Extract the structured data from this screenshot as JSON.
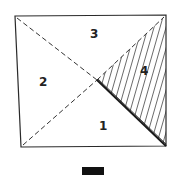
{
  "diagram": {
    "regions": [
      {
        "id": "1",
        "label": "1",
        "position": "bottom",
        "shaded": false
      },
      {
        "id": "2",
        "label": "2",
        "position": "left",
        "shaded": false
      },
      {
        "id": "3",
        "label": "3",
        "position": "top",
        "shaded": false
      },
      {
        "id": "4",
        "label": "4",
        "position": "right",
        "shaded": true
      }
    ],
    "colors": {
      "stroke": "#2a2a2a",
      "hatch": "#444444",
      "bar": "#111111"
    }
  }
}
